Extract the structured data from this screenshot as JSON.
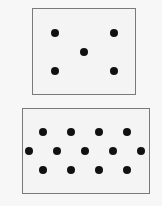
{
  "diagram": {
    "boxes": [
      {
        "name": "top-box",
        "x": 32,
        "y": 8,
        "width": 104,
        "height": 87,
        "dot_count": 5,
        "dots": [
          [
            55,
            33
          ],
          [
            114,
            33
          ],
          [
            84,
            52
          ],
          [
            55,
            71
          ],
          [
            114,
            71
          ]
        ]
      },
      {
        "name": "bottom-box",
        "x": 22,
        "y": 108,
        "width": 128,
        "height": 86,
        "dot_count": 13,
        "dots": [
          [
            43,
            132
          ],
          [
            71,
            132
          ],
          [
            99,
            132
          ],
          [
            127,
            132
          ],
          [
            29,
            151
          ],
          [
            57,
            151
          ],
          [
            85,
            151
          ],
          [
            113,
            151
          ],
          [
            141,
            151
          ],
          [
            43,
            170
          ],
          [
            71,
            170
          ],
          [
            99,
            170
          ],
          [
            127,
            170
          ]
        ]
      }
    ],
    "colors": {
      "border": "#7a7a7a",
      "dot": "#111111",
      "background": "#f4f4f4"
    }
  }
}
